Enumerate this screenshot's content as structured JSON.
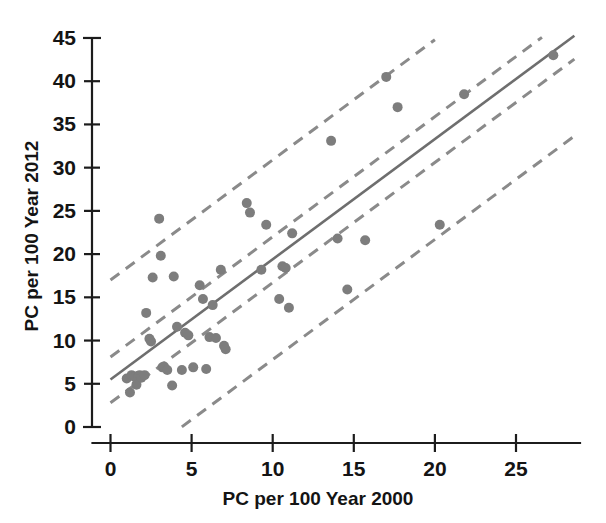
{
  "chart_data": {
    "type": "scatter",
    "title": "",
    "xlabel": "PC per 100 Year 2000",
    "ylabel": "PC per 100 Year 2012",
    "xlim": [
      0,
      29
    ],
    "ylim": [
      0,
      45
    ],
    "xticks": [
      0,
      5,
      10,
      15,
      20,
      25
    ],
    "yticks": [
      0,
      5,
      10,
      15,
      20,
      25,
      30,
      35,
      40,
      45
    ],
    "xtick_labels": [
      "0",
      "5",
      "10",
      "15",
      "20",
      "25"
    ],
    "ytick_labels": [
      "0",
      "5",
      "10",
      "15",
      "20",
      "25",
      "30",
      "35",
      "40",
      "45"
    ],
    "grid": false,
    "legend": null,
    "point_color": "#7d7d7d",
    "line_color": "#6e6e6e",
    "band_color": "#8a8a8a",
    "marker": "circle",
    "marker_size": 9,
    "points": [
      {
        "x": 1.0,
        "y": 5.6
      },
      {
        "x": 1.2,
        "y": 4.0
      },
      {
        "x": 1.3,
        "y": 6.0
      },
      {
        "x": 1.5,
        "y": 5.8
      },
      {
        "x": 1.6,
        "y": 4.9
      },
      {
        "x": 1.7,
        "y": 5.9
      },
      {
        "x": 1.8,
        "y": 6.0
      },
      {
        "x": 1.9,
        "y": 5.7
      },
      {
        "x": 2.1,
        "y": 6.0
      },
      {
        "x": 2.2,
        "y": 13.2
      },
      {
        "x": 2.4,
        "y": 10.2
      },
      {
        "x": 2.5,
        "y": 9.9
      },
      {
        "x": 2.6,
        "y": 17.3
      },
      {
        "x": 3.0,
        "y": 24.1
      },
      {
        "x": 3.1,
        "y": 19.8
      },
      {
        "x": 3.2,
        "y": 6.9
      },
      {
        "x": 3.3,
        "y": 7.0
      },
      {
        "x": 3.5,
        "y": 6.6
      },
      {
        "x": 3.8,
        "y": 4.8
      },
      {
        "x": 3.9,
        "y": 17.4
      },
      {
        "x": 4.1,
        "y": 11.6
      },
      {
        "x": 4.4,
        "y": 6.6
      },
      {
        "x": 4.6,
        "y": 10.9
      },
      {
        "x": 4.8,
        "y": 10.6
      },
      {
        "x": 5.1,
        "y": 6.9
      },
      {
        "x": 5.5,
        "y": 16.4
      },
      {
        "x": 5.7,
        "y": 14.8
      },
      {
        "x": 5.9,
        "y": 6.7
      },
      {
        "x": 6.1,
        "y": 10.4
      },
      {
        "x": 6.3,
        "y": 14.1
      },
      {
        "x": 6.5,
        "y": 10.3
      },
      {
        "x": 6.8,
        "y": 18.2
      },
      {
        "x": 7.0,
        "y": 9.4
      },
      {
        "x": 7.1,
        "y": 9.0
      },
      {
        "x": 8.4,
        "y": 25.9
      },
      {
        "x": 8.6,
        "y": 24.8
      },
      {
        "x": 9.3,
        "y": 18.2
      },
      {
        "x": 9.6,
        "y": 23.4
      },
      {
        "x": 10.4,
        "y": 14.8
      },
      {
        "x": 10.6,
        "y": 18.6
      },
      {
        "x": 10.8,
        "y": 18.4
      },
      {
        "x": 11.0,
        "y": 13.8
      },
      {
        "x": 11.2,
        "y": 22.4
      },
      {
        "x": 13.6,
        "y": 33.1
      },
      {
        "x": 14.0,
        "y": 21.8
      },
      {
        "x": 14.6,
        "y": 15.9
      },
      {
        "x": 15.7,
        "y": 21.6
      },
      {
        "x": 17.0,
        "y": 40.5
      },
      {
        "x": 17.7,
        "y": 37.0
      },
      {
        "x": 20.3,
        "y": 23.4
      },
      {
        "x": 21.8,
        "y": 38.5
      },
      {
        "x": 27.3,
        "y": 43.0
      }
    ],
    "fit_line": {
      "slope": 1.39,
      "intercept": 5.5,
      "x_start": 0,
      "x_end": 28.6
    },
    "bands": [
      {
        "name": "upper-outer",
        "slope": 1.39,
        "intercept": 17.0,
        "x_start": 0,
        "x_end": 20.0
      },
      {
        "name": "upper-inner",
        "slope": 1.39,
        "intercept": 8.1,
        "x_start": 0,
        "x_end": 26.6
      },
      {
        "name": "lower-inner",
        "slope": 1.39,
        "intercept": 2.8,
        "x_start": 0,
        "x_end": 28.6
      },
      {
        "name": "lower-outer",
        "slope": 1.39,
        "intercept": -6.1,
        "x_start": 4.4,
        "x_end": 28.6
      }
    ]
  },
  "axis": {
    "x_title": "PC per 100 Year 2000",
    "y_title": "PC per 100 Year 2012"
  }
}
